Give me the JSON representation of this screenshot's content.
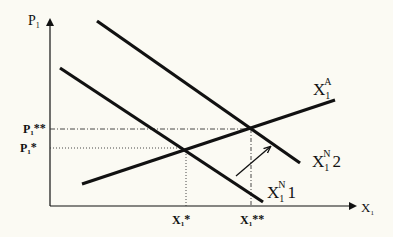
{
  "diagram": {
    "type": "supply-demand",
    "background": "#fbfaf3",
    "line_color": "#111111",
    "axes": {
      "y_label": "P",
      "y_label_sub": "1",
      "x_label": "X",
      "x_label_sub": "1"
    },
    "curves": [
      {
        "id": "supply",
        "label": "X",
        "sub": "1",
        "sup": "A",
        "suffix": ""
      },
      {
        "id": "demand_2",
        "label": "X",
        "sub": "1",
        "sup": "N",
        "suffix": "2"
      },
      {
        "id": "demand_1",
        "label": "X",
        "sub": "1",
        "sup": "N",
        "suffix": "1"
      }
    ],
    "ticks": {
      "p_double_star": {
        "base": "P",
        "sub": "1",
        "mark": "**"
      },
      "p_star": {
        "base": "P",
        "sub": "1",
        "mark": "*"
      },
      "x_star": {
        "base": "X",
        "sub": "1",
        "mark": "*"
      },
      "x_double_star": {
        "base": "X",
        "sub": "1",
        "mark": "**"
      }
    },
    "annotations": [
      {
        "id": "shift-arrow",
        "description": "arrow showing demand shift from X1N1 to X1N2"
      }
    ]
  }
}
